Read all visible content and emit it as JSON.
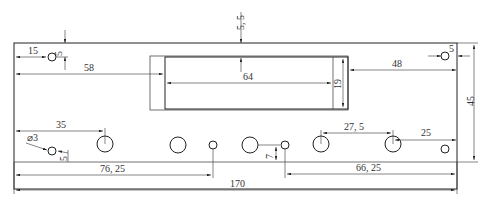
{
  "drawing": {
    "title": "Panel drawing with holes and rectangular cutout",
    "line_color": "#222222",
    "background": "#ffffff",
    "dimensions": {
      "top_hole_x": "15",
      "top_hole_y": "5",
      "cutout_offset_x": "58",
      "cutout_top_offset": "5, 5",
      "cutout_width": "64",
      "cutout_height": "19",
      "right_hole_x": "5",
      "right_span": "48",
      "overall_height": "45",
      "first_large_hole_x": "35",
      "small_hole_dia": "⌀3",
      "small_hole_y": "5",
      "hole_pitch": "27, 5",
      "right_large_hole_offset": "25",
      "hole_row_y": "7",
      "left_span": "76, 25",
      "right_span_bottom": "66, 25",
      "overall_width": "170"
    }
  }
}
